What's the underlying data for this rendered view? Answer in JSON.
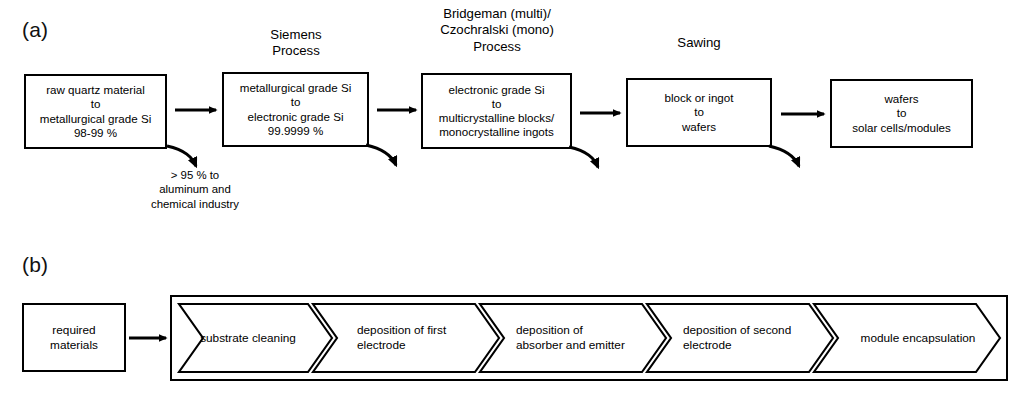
{
  "figure": {
    "background": "#ffffff",
    "line_color": "#000000"
  },
  "panel_a": {
    "letter": "(a)",
    "captions": [
      {
        "id": "siemens",
        "lines": [
          "Siemens",
          "Process"
        ]
      },
      {
        "id": "bridgeman",
        "lines": [
          "Bridgeman (multi)/",
          "Czochralski (mono)",
          "Process"
        ]
      },
      {
        "id": "sawing",
        "lines": [
          "Sawing"
        ]
      }
    ],
    "boxes": [
      {
        "id": "box1",
        "lines": [
          "raw quartz material",
          "to",
          "metallurgical grade Si",
          "98-99 %"
        ]
      },
      {
        "id": "box2",
        "lines": [
          "metallurgical grade Si",
          "to",
          "electronic grade Si",
          "99.9999 %"
        ]
      },
      {
        "id": "box3",
        "lines": [
          "electronic grade Si",
          "to",
          "multicrystalline blocks/",
          "monocrystalline ingots"
        ]
      },
      {
        "id": "box4",
        "lines": [
          "block or ingot",
          "to",
          "wafers"
        ]
      },
      {
        "id": "box5",
        "lines": [
          "wafers",
          "to",
          "solar cells/modules"
        ]
      }
    ],
    "annotation": {
      "id": "byproduct-note",
      "lines": [
        "> 95 % to",
        "aluminum and",
        "chemical industry"
      ]
    },
    "arrow_icons": {
      "straight": "arrow-right-icon",
      "curved": "curved-arrow-down-right-icon"
    }
  },
  "panel_b": {
    "letter": "(b)",
    "input_box": {
      "id": "required-materials",
      "lines": [
        "required",
        "materials"
      ]
    },
    "feed_arrow_icon": "arrow-right-icon",
    "steps": [
      {
        "id": "step1",
        "lines": [
          "substrate cleaning"
        ]
      },
      {
        "id": "step2",
        "lines": [
          "deposition of first",
          "electrode"
        ]
      },
      {
        "id": "step3",
        "lines": [
          "deposition of",
          "absorber and emitter"
        ]
      },
      {
        "id": "step4",
        "lines": [
          "deposition of second",
          "electrode"
        ]
      },
      {
        "id": "step5",
        "lines": [
          "module encapsulation"
        ]
      }
    ]
  }
}
